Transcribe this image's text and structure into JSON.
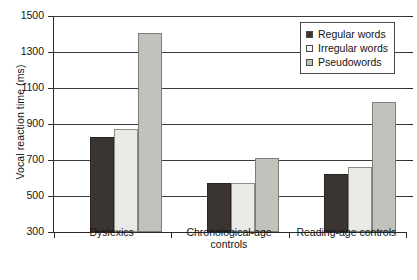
{
  "chart_data": {
    "type": "bar",
    "title": "",
    "xlabel": "",
    "ylabel": "Vocal reaction time (ms)",
    "ylim": [
      300,
      1500
    ],
    "ytick_step": 200,
    "yticks": [
      300,
      500,
      700,
      900,
      1100,
      1300,
      1500
    ],
    "ytick_labels": [
      "300",
      "500",
      "700",
      "900",
      "1100",
      "1300",
      "1500"
    ],
    "grid": true,
    "legend_position": "top-right",
    "categories": [
      "Dyslexics",
      "Chronological-age controls",
      "Reading-age controls"
    ],
    "category_lines": [
      [
        "Dyslexics"
      ],
      [
        "Chronological-age",
        "controls"
      ],
      [
        "Reading-age controls"
      ]
    ],
    "series": [
      {
        "name": "Regular words",
        "key": "regular",
        "color": "#3b3531",
        "values": [
          830,
          570,
          620
        ]
      },
      {
        "name": "Irregular words",
        "key": "irregular",
        "color": "#e9e9e5",
        "values": [
          875,
          570,
          660
        ]
      },
      {
        "name": "Pseudowords",
        "key": "pseudo",
        "color": "#c2c2bd",
        "values": [
          1405,
          710,
          1020
        ]
      }
    ]
  },
  "legend": {
    "items": [
      {
        "label": "Regular words"
      },
      {
        "label": "Irregular words"
      },
      {
        "label": "Pseudowords"
      }
    ]
  },
  "axis": {
    "y_title": "Vocal reaction time (ms)"
  }
}
